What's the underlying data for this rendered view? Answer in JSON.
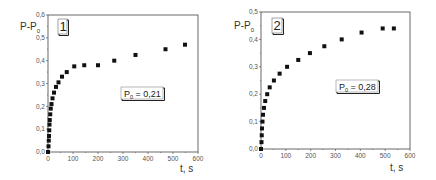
{
  "chart_data": [
    {
      "type": "scatter",
      "panel_label": "1",
      "title": "",
      "xlabel": "t, s",
      "ylabel": "P-P0",
      "ylabel_main": "P-P",
      "ylabel_sub": "0",
      "annotation": "P0 = 0,21",
      "annotation_main": "P",
      "annotation_sub": "0",
      "annotation_value": " = 0,21",
      "xlim": [
        0,
        600
      ],
      "ylim": [
        0,
        0.6
      ],
      "xticks": [
        "0",
        "100",
        "200",
        "300",
        "400",
        "500",
        "600"
      ],
      "yticks": [
        "0,0",
        "0,1",
        "0,2",
        "0,3",
        "0,4",
        "0,5",
        "0,6"
      ],
      "grid": false,
      "x": [
        0,
        2,
        3,
        4,
        5,
        6,
        7,
        9,
        11,
        14,
        18,
        24,
        32,
        42,
        56,
        75,
        105,
        145,
        200,
        265,
        350,
        470,
        548
      ],
      "y": [
        0.0,
        0.025,
        0.05,
        0.07,
        0.095,
        0.12,
        0.14,
        0.165,
        0.19,
        0.21,
        0.235,
        0.26,
        0.285,
        0.305,
        0.33,
        0.35,
        0.375,
        0.38,
        0.38,
        0.4,
        0.425,
        0.45,
        0.47
      ]
    },
    {
      "type": "scatter",
      "panel_label": "2",
      "title": "",
      "xlabel": "t, s",
      "ylabel": "P-P0",
      "ylabel_main": "P-P",
      "ylabel_sub": "0",
      "annotation": "P0 = 0,28",
      "annotation_main": "P",
      "annotation_sub": "0",
      "annotation_value": " = 0,28",
      "xlim": [
        0,
        600
      ],
      "ylim": [
        0,
        0.5
      ],
      "xticks": [
        "0",
        "100",
        "200",
        "300",
        "400",
        "500",
        "600"
      ],
      "yticks": [
        "0,0",
        "0,1",
        "0,2",
        "0,3",
        "0,4",
        "0,5"
      ],
      "grid": false,
      "x": [
        0,
        2,
        3,
        4,
        6,
        8,
        12,
        17,
        25,
        35,
        52,
        75,
        105,
        150,
        197,
        255,
        325,
        405,
        490,
        535
      ],
      "y": [
        0.0,
        0.025,
        0.05,
        0.075,
        0.1,
        0.125,
        0.15,
        0.175,
        0.2,
        0.225,
        0.25,
        0.275,
        0.3,
        0.325,
        0.35,
        0.375,
        0.4,
        0.425,
        0.44,
        0.44
      ]
    }
  ]
}
